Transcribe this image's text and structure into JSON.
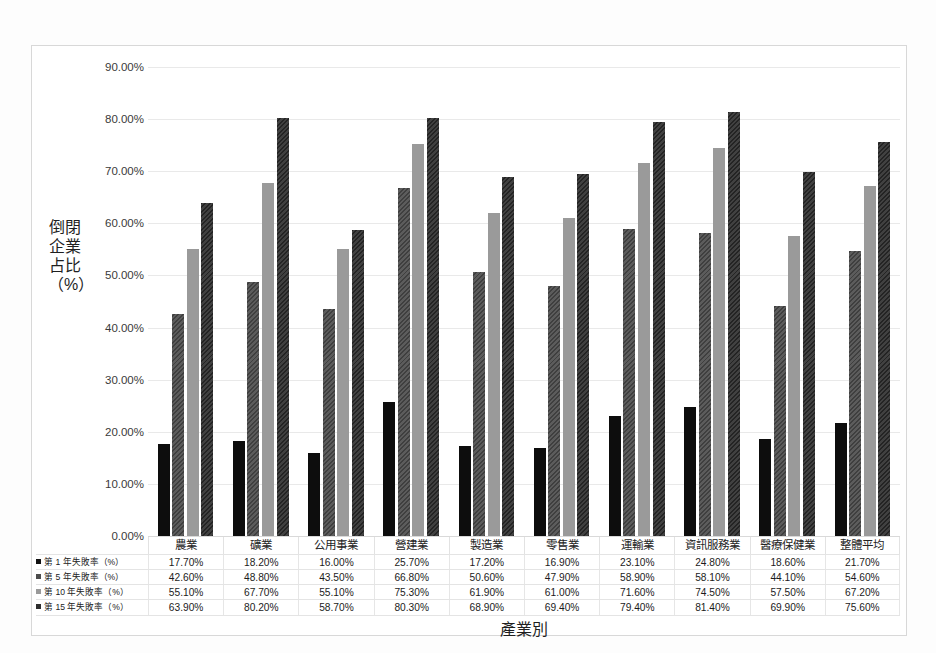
{
  "chart_data": {
    "type": "bar",
    "title": "",
    "xlabel": "產業別",
    "ylabel": "倒閉企業占比（%）",
    "ylim": [
      0,
      90
    ],
    "ytick_labels": [
      "90.00%",
      "80.00%",
      "70.00%",
      "60.00%",
      "50.00%",
      "40.00%",
      "30.00%",
      "20.00%",
      "10.00%",
      "0.00%"
    ],
    "ytick_values": [
      90,
      80,
      70,
      60,
      50,
      40,
      30,
      20,
      10,
      0
    ],
    "grid": "horizontal",
    "legend_position": "table-left",
    "categories": [
      "農業",
      "礦業",
      "公用事業",
      "營建業",
      "製造業",
      "零售業",
      "運輸業",
      "資訊服務業",
      "醫療保健業",
      "整體平均"
    ],
    "series": [
      {
        "name": "第 1 年失敗率（%）",
        "color": "#0d0d0d",
        "pattern": "solid",
        "values": [
          17.7,
          18.2,
          16.0,
          25.7,
          17.2,
          16.9,
          23.1,
          24.8,
          18.6,
          21.7
        ],
        "labels": [
          "17.70%",
          "18.20%",
          "16.00%",
          "25.70%",
          "17.20%",
          "16.90%",
          "23.10%",
          "24.80%",
          "18.60%",
          "21.70%"
        ]
      },
      {
        "name": "第 5 年失敗率（%）",
        "color": "#4d4d4d",
        "pattern": "diagonal-hatch",
        "values": [
          42.6,
          48.8,
          43.5,
          66.8,
          50.6,
          47.9,
          58.9,
          58.1,
          44.1,
          54.6
        ],
        "labels": [
          "42.60%",
          "48.80%",
          "43.50%",
          "66.80%",
          "50.60%",
          "47.90%",
          "58.90%",
          "58.10%",
          "44.10%",
          "54.60%"
        ]
      },
      {
        "name": "第 10 年失敗率（%）",
        "color": "#9a9a9a",
        "pattern": "solid",
        "values": [
          55.1,
          67.7,
          55.1,
          75.3,
          61.9,
          61.0,
          71.6,
          74.5,
          57.5,
          67.2
        ],
        "labels": [
          "55.10%",
          "67.70%",
          "55.10%",
          "75.30%",
          "61.90%",
          "61.00%",
          "71.60%",
          "74.50%",
          "57.50%",
          "67.20%"
        ]
      },
      {
        "name": "第 15 年失敗率（%）",
        "color": "#2e2e2e",
        "pattern": "diagonal-hatch",
        "values": [
          63.9,
          80.2,
          58.7,
          80.3,
          68.9,
          69.4,
          79.4,
          81.4,
          69.9,
          75.6
        ],
        "labels": [
          "63.90%",
          "80.20%",
          "58.70%",
          "80.30%",
          "68.90%",
          "69.40%",
          "79.40%",
          "81.40%",
          "69.90%",
          "75.60%"
        ]
      }
    ]
  }
}
